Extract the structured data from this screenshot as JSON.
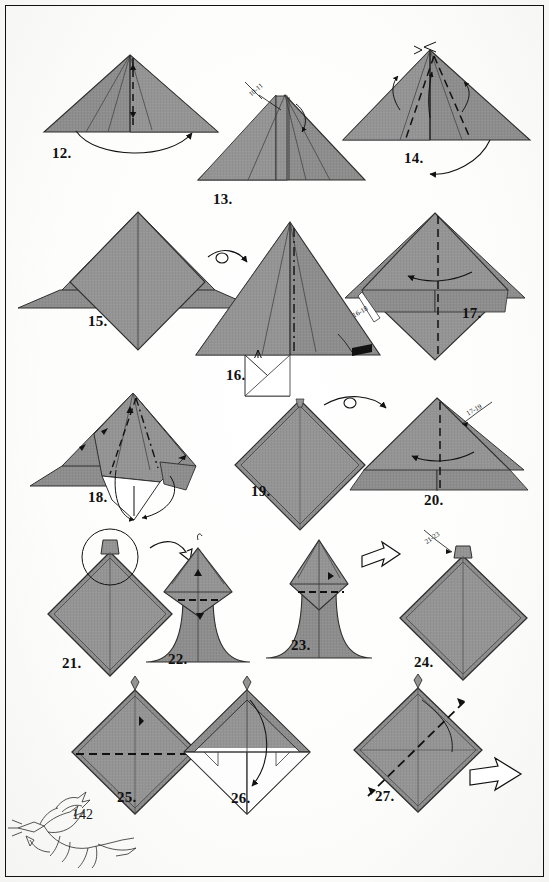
{
  "document": {
    "type": "origami-instruction-page",
    "page_number": "142",
    "background_color": "#ffffff",
    "paper_fill": "#8d8d8d",
    "paper_edge": "#3a3a3a",
    "line_color": "#111111"
  },
  "steps": [
    {
      "id": "12",
      "label": "12.",
      "x": 52,
      "y": 145,
      "figure": "wide-triangle-center-dashed"
    },
    {
      "id": "13",
      "label": "13.",
      "x": 213,
      "y": 191,
      "figure": "triangle-with-vertical-flap"
    },
    {
      "id": "14",
      "label": "14.",
      "x": 404,
      "y": 150,
      "figure": "tall-triangle-dashed-diagonals"
    },
    {
      "id": "15",
      "label": "15.",
      "x": 88,
      "y": 313,
      "figure": "diamond-with-wings"
    },
    {
      "id": "16",
      "label": "16.",
      "x": 226,
      "y": 367,
      "figure": "triangle-with-white-notch"
    },
    {
      "id": "17",
      "label": "17.",
      "x": 462,
      "y": 305,
      "figure": "diamond-wings-vertical-dashed"
    },
    {
      "id": "18",
      "label": "18.",
      "x": 88,
      "y": 489,
      "figure": "diamond-open-pocket"
    },
    {
      "id": "19",
      "label": "19.",
      "x": 251,
      "y": 483,
      "figure": "plain-diamond"
    },
    {
      "id": "20",
      "label": "20.",
      "x": 424,
      "y": 492,
      "figure": "diamond-dashed-center"
    },
    {
      "id": "21",
      "label": "21.",
      "x": 62,
      "y": 655,
      "figure": "diamond-small-tip-circled"
    },
    {
      "id": "22",
      "label": "22.",
      "x": 168,
      "y": 651,
      "figure": "hood-shape-dashed"
    },
    {
      "id": "23",
      "label": "23.",
      "x": 291,
      "y": 637,
      "figure": "hood-shape-pointed"
    },
    {
      "id": "24",
      "label": "24.",
      "x": 414,
      "y": 654,
      "figure": "diamond-with-tip"
    },
    {
      "id": "25",
      "label": "25.",
      "x": 117,
      "y": 789,
      "figure": "diamond-horizontal-dashed"
    },
    {
      "id": "26",
      "label": "26.",
      "x": 231,
      "y": 790,
      "figure": "white-diamond-arrow-down"
    },
    {
      "id": "27",
      "label": "27.",
      "x": 375,
      "y": 788,
      "figure": "diamond-diagonal-dashed"
    }
  ],
  "reference_labels": [
    {
      "text": "10-11",
      "x": 248,
      "y": 86,
      "rotate": -40,
      "for_step": "13"
    },
    {
      "text": "16-18",
      "x": 352,
      "y": 308,
      "rotate": -30,
      "for_step": "16"
    },
    {
      "text": "17-19",
      "x": 466,
      "y": 406,
      "rotate": -30,
      "for_step": "20"
    },
    {
      "text": "21-23",
      "x": 424,
      "y": 534,
      "rotate": -35,
      "for_step": "24"
    }
  ],
  "page_footer": {
    "number": "142",
    "figure_caption": "origami-dragon-sketch"
  },
  "annotations": {
    "fold_arrow": "fold-arrow",
    "turn_over_arrow": "turn-over-arrow",
    "zoom_circle": "magnify-circle",
    "valley_fold": "dashed-line",
    "mountain_fold": "dash-dot-line"
  }
}
